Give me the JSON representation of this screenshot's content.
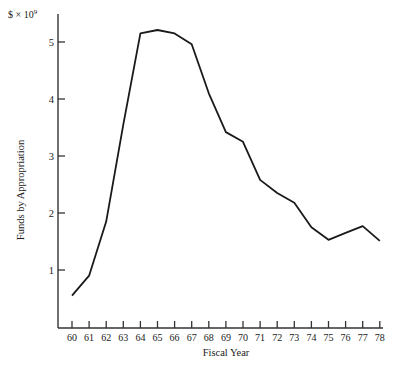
{
  "chart_data": {
    "type": "line",
    "title": "",
    "unit_label": "$ × 10",
    "unit_exponent": "9",
    "xlabel": "Fiscal Year",
    "ylabel": "Funds by Appropriation",
    "x": [
      "60",
      "61",
      "62",
      "63",
      "64",
      "65",
      "66",
      "67",
      "68",
      "69",
      "70",
      "71",
      "72",
      "73",
      "74",
      "75",
      "76",
      "77",
      "78"
    ],
    "series": [
      {
        "name": "Funds by Appropriation",
        "values": [
          0.55,
          0.9,
          1.85,
          3.55,
          5.15,
          5.21,
          5.15,
          4.96,
          4.1,
          3.42,
          3.25,
          2.58,
          2.35,
          2.18,
          1.75,
          1.53,
          1.65,
          1.77,
          1.51
        ]
      }
    ],
    "yticks": [
      "1",
      "2",
      "3",
      "4",
      "5"
    ],
    "ylim": [
      0,
      5.5
    ],
    "grid": false,
    "legend": null,
    "line_color": "#1a1a1a"
  }
}
